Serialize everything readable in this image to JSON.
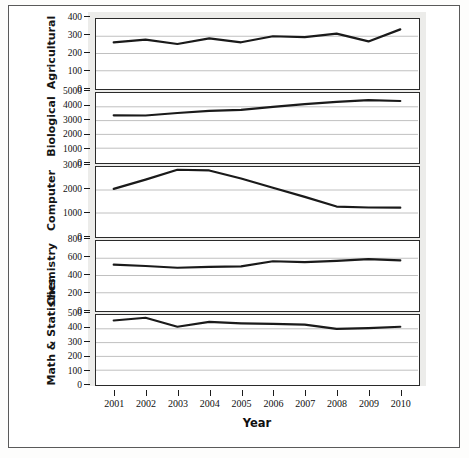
{
  "figure": {
    "xaxis_title": "Year",
    "line_color": "#1a1a1a",
    "grid_color": "#b9b9b9",
    "panel_border_color": "#2a2a2a",
    "backdrop_color": "#ececea"
  },
  "chart_data": {
    "type": "line",
    "title": "",
    "xlabel": "Year",
    "ylabel": "",
    "grid": true,
    "legend": "none",
    "layout": "small-multiples-vertical-stack",
    "x": [
      2001,
      2002,
      2003,
      2004,
      2005,
      2006,
      2007,
      2008,
      2009,
      2010
    ],
    "xtick_labels": [
      "2001",
      "2002",
      "2003",
      "2004",
      "2005",
      "2006",
      "2007",
      "2008",
      "2009",
      "2010"
    ],
    "panels": [
      {
        "name": "Agricultural",
        "ylim": [
          0,
          400
        ],
        "yticks": [
          0,
          100,
          200,
          300,
          400
        ],
        "ytick_labels": [
          "0",
          "100",
          "200",
          "300",
          "400"
        ],
        "values": [
          265,
          280,
          255,
          288,
          265,
          300,
          295,
          315,
          270,
          340
        ]
      },
      {
        "name": "Biological",
        "ylim": [
          0,
          5000
        ],
        "yticks": [
          0,
          1000,
          2000,
          3000,
          4000,
          5000
        ],
        "ytick_labels": [
          "0",
          "1000",
          "2000",
          "3000",
          "4000",
          "5000"
        ],
        "values": [
          3380,
          3370,
          3550,
          3700,
          3780,
          4000,
          4200,
          4350,
          4480,
          4420
        ]
      },
      {
        "name": "Computer",
        "ylim": [
          0,
          3000
        ],
        "yticks": [
          0,
          1000,
          2000,
          3000
        ],
        "ytick_labels": [
          "0",
          "1000",
          "2000",
          "3000"
        ],
        "values": [
          2050,
          2450,
          2880,
          2850,
          2500,
          2100,
          1700,
          1280,
          1240,
          1230
        ]
      },
      {
        "name": "Chemistry",
        "ylim": [
          0,
          800
        ],
        "yticks": [
          0,
          200,
          400,
          600,
          800
        ],
        "ytick_labels": [
          "0",
          "200",
          "400",
          "600",
          "800"
        ],
        "values": [
          525,
          510,
          490,
          500,
          505,
          565,
          555,
          570,
          590,
          575
        ]
      },
      {
        "name": "Math & Statistics",
        "ylim": [
          0,
          500
        ],
        "yticks": [
          0,
          100,
          200,
          300,
          400,
          500
        ],
        "ytick_labels": [
          "0",
          "100",
          "200",
          "300",
          "400",
          "500"
        ],
        "values": [
          460,
          480,
          415,
          450,
          440,
          435,
          430,
          400,
          405,
          415
        ]
      }
    ]
  }
}
